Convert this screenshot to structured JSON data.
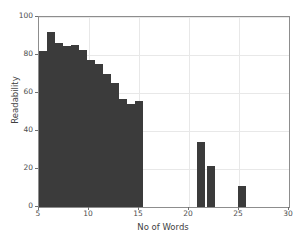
{
  "chart_data": {
    "type": "bar",
    "title": "",
    "xlabel": "No of Words",
    "ylabel": "Readability",
    "xlim": [
      5,
      30
    ],
    "ylim": [
      0,
      100
    ],
    "grid": true,
    "legend": null,
    "bar_color": "#3b3b3b",
    "xticks": [
      5,
      10,
      15,
      20,
      25,
      30
    ],
    "yticks": [
      0,
      20,
      40,
      60,
      80,
      100
    ],
    "xtick_labels": [
      "5",
      "10",
      "15",
      "20",
      "25",
      "30"
    ],
    "ytick_labels": [
      "0",
      "20",
      "40",
      "60",
      "80",
      "100"
    ],
    "bar_width": 0.78,
    "x": [
      5.4,
      6.2,
      7.0,
      7.8,
      8.6,
      9.4,
      10.2,
      11.0,
      11.8,
      12.6,
      13.4,
      14.2,
      15.0,
      15.8,
      16.6,
      17.4,
      21.2,
      22.2,
      25.3
    ],
    "values": [
      82,
      92,
      86.5,
      85,
      85.5,
      82.5,
      77.5,
      75.5,
      70,
      65.5,
      57,
      54,
      56,
      0,
      0,
      0,
      34,
      21.5,
      11
    ],
    "bars": [
      {
        "x": 5.4,
        "y": 82
      },
      {
        "x": 6.2,
        "y": 92
      },
      {
        "x": 7.0,
        "y": 86.5
      },
      {
        "x": 7.8,
        "y": 85
      },
      {
        "x": 8.6,
        "y": 85.5
      },
      {
        "x": 9.4,
        "y": 82.5
      },
      {
        "x": 10.2,
        "y": 77.5
      },
      {
        "x": 11.0,
        "y": 75.5
      },
      {
        "x": 11.8,
        "y": 70
      },
      {
        "x": 12.6,
        "y": 65.5
      },
      {
        "x": 13.4,
        "y": 57
      },
      {
        "x": 14.2,
        "y": 54
      },
      {
        "x": 15.0,
        "y": 56
      },
      {
        "x": 21.2,
        "y": 34
      },
      {
        "x": 22.2,
        "y": 21.5
      },
      {
        "x": 25.3,
        "y": 11
      }
    ]
  }
}
